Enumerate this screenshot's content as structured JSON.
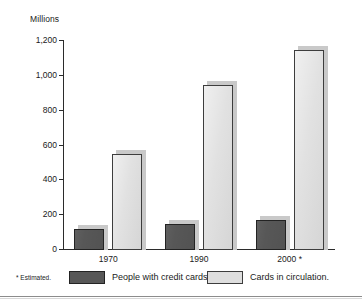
{
  "chart_data": {
    "type": "bar",
    "title": "",
    "subtitle": "",
    "xlabel": "",
    "ylabel": "Millions",
    "categories": [
      "1970",
      "1990",
      "2000 *"
    ],
    "series": [
      {
        "name": "People with credit cards.",
        "color": "#575757",
        "values": [
          120,
          150,
          170
        ]
      },
      {
        "name": "Cards in circulation.",
        "color": "#dedede",
        "values": [
          550,
          945,
          1150
        ]
      }
    ],
    "ylim": [
      0,
      1200
    ],
    "yticks": [
      0,
      200,
      400,
      600,
      800,
      1000,
      1200
    ],
    "ytick_labels": [
      "0",
      "200",
      "400",
      "600",
      "800",
      "1,000",
      "1,200"
    ],
    "grid": false,
    "legend_position": "bottom",
    "annotations": [
      "* Estimated."
    ]
  },
  "axis": {
    "y_title": "Millions"
  },
  "footnote": {
    "text": "* Estimated."
  }
}
